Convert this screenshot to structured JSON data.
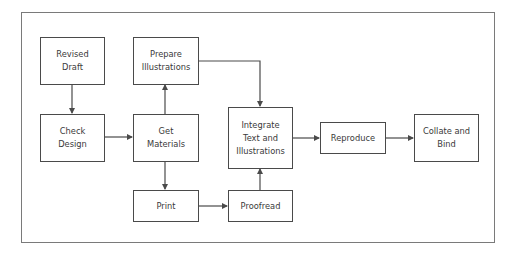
{
  "diagram": {
    "nodes": {
      "revised_draft": "Revised\nDraft",
      "check_design": "Check\nDesign",
      "prepare_illustrations": "Prepare\nIllustrations",
      "get_materials": "Get\nMaterials",
      "print": "Print",
      "proofread": "Proofread",
      "integrate": "Integrate\nText and\nIllustrations",
      "reproduce": "Reproduce",
      "collate_bind": "Collate and\nBind"
    },
    "edges": [
      {
        "from": "Revised Draft",
        "to": "Check Design"
      },
      {
        "from": "Check Design",
        "to": "Get Materials"
      },
      {
        "from": "Get Materials",
        "to": "Prepare Illustrations"
      },
      {
        "from": "Get Materials",
        "to": "Print"
      },
      {
        "from": "Print",
        "to": "Proofread"
      },
      {
        "from": "Prepare Illustrations",
        "to": "Integrate Text and Illustrations"
      },
      {
        "from": "Proofread",
        "to": "Integrate Text and Illustrations"
      },
      {
        "from": "Integrate Text and Illustrations",
        "to": "Reproduce"
      },
      {
        "from": "Reproduce",
        "to": "Collate and Bind"
      }
    ],
    "colors": {
      "stroke": "#4a4a4a",
      "frame": "#7a7a7a",
      "text": "#3a3a3a"
    }
  }
}
